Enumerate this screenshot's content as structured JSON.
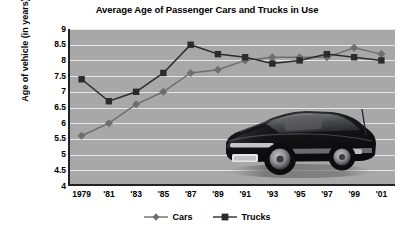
{
  "chart_data": {
    "type": "line",
    "title": "Average Age of Passenger Cars and Trucks in Use",
    "xlabel": "",
    "ylabel": "Age of vehicle (in years)",
    "x": [
      1979,
      1981,
      1983,
      1985,
      1987,
      1989,
      1991,
      1993,
      1995,
      1997,
      1999,
      2001
    ],
    "categories": [
      "1979",
      "'81",
      "'83",
      "'85",
      "'87",
      "'89",
      "'91",
      "'93",
      "'95",
      "'97",
      "'99",
      "'01"
    ],
    "series": [
      {
        "name": "Cars",
        "marker": "diamond",
        "color": "#6e6e6e",
        "values": [
          5.6,
          6.0,
          6.6,
          7.0,
          7.6,
          7.7,
          8.0,
          8.1,
          8.1,
          8.1,
          8.4,
          8.2
        ]
      },
      {
        "name": "Trucks",
        "marker": "square",
        "color": "#2b2b2b",
        "values": [
          7.4,
          6.7,
          7.0,
          7.6,
          8.5,
          8.2,
          8.1,
          7.9,
          8.0,
          8.2,
          8.1,
          8.0
        ]
      }
    ],
    "ylim": [
      4,
      9
    ],
    "ytick_values": [
      9,
      8.5,
      8,
      7.5,
      7,
      6.5,
      6,
      5.5,
      5,
      4.5,
      4
    ],
    "ytick_labels": [
      "9",
      "8.5",
      "8",
      "7.5",
      "7",
      "6.5",
      "6",
      "5.5",
      "5",
      "4.5",
      "4"
    ],
    "grid": true,
    "legend_position": "bottom",
    "plot_background": "#a8a8a8",
    "gridline_color": "#e6e6e6"
  },
  "legend": {
    "items": [
      {
        "label": "Cars",
        "marker": "diamond-marker"
      },
      {
        "label": "Trucks",
        "marker": "square-marker"
      }
    ]
  },
  "decoration": {
    "photo_caption": "sports-car-photo"
  }
}
